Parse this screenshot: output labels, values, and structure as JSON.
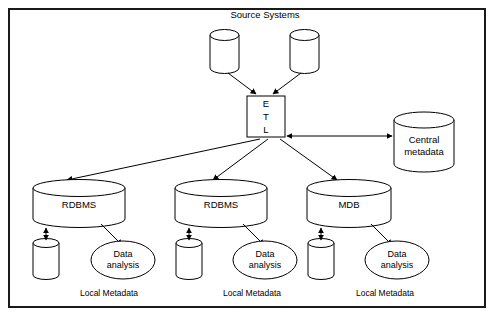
{
  "figure": {
    "title": "Source Systems",
    "border_color": "#1a1a1a",
    "background_color": "#ffffff",
    "stroke_color": "#000000"
  },
  "nodes": {
    "source_db_left": {
      "label": "",
      "type": "cylinder"
    },
    "source_db_right": {
      "label": "",
      "type": "cylinder"
    },
    "etl": {
      "line1": "E",
      "line2": "T",
      "line3": "L",
      "type": "box"
    },
    "central_metadata": {
      "line1": "Central",
      "line2": "metadata",
      "type": "cylinder"
    },
    "warehouse_1": {
      "label": "RDBMS",
      "type": "cylinder"
    },
    "warehouse_2": {
      "label": "RDBMS",
      "type": "cylinder"
    },
    "warehouse_3": {
      "label": "MDB",
      "type": "cylinder"
    },
    "local_metadata_1": {
      "label": "",
      "type": "cylinder",
      "caption": "Local Metadata"
    },
    "local_metadata_2": {
      "label": "",
      "type": "cylinder",
      "caption": "Local Metadata"
    },
    "local_metadata_3": {
      "label": "",
      "type": "cylinder",
      "caption": "Local Metadata"
    },
    "data_analysis_1": {
      "line1": "Data",
      "line2": "analysis",
      "type": "ellipse"
    },
    "data_analysis_2": {
      "line1": "Data",
      "line2": "analysis",
      "type": "ellipse"
    },
    "data_analysis_3": {
      "line1": "Data",
      "line2": "analysis",
      "type": "ellipse"
    }
  },
  "edges": [
    {
      "from": "source_db_left",
      "to": "etl",
      "arrow": "single"
    },
    {
      "from": "source_db_right",
      "to": "etl",
      "arrow": "single"
    },
    {
      "from": "etl",
      "to": "central_metadata",
      "arrow": "double"
    },
    {
      "from": "etl",
      "to": "warehouse_1",
      "arrow": "single"
    },
    {
      "from": "etl",
      "to": "warehouse_2",
      "arrow": "single"
    },
    {
      "from": "etl",
      "to": "warehouse_3",
      "arrow": "single"
    },
    {
      "from": "warehouse_1",
      "to": "local_metadata_1",
      "arrow": "double"
    },
    {
      "from": "warehouse_2",
      "to": "local_metadata_2",
      "arrow": "double"
    },
    {
      "from": "warehouse_3",
      "to": "local_metadata_3",
      "arrow": "double"
    },
    {
      "from": "warehouse_1",
      "to": "data_analysis_1",
      "arrow": "single"
    },
    {
      "from": "warehouse_2",
      "to": "data_analysis_2",
      "arrow": "single"
    },
    {
      "from": "warehouse_3",
      "to": "data_analysis_3",
      "arrow": "single"
    }
  ]
}
